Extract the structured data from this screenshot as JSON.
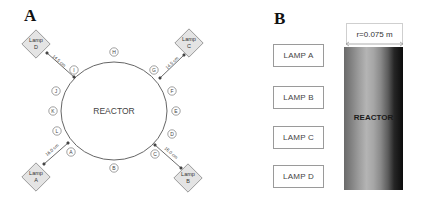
{
  "panel_a": {
    "letter": "A",
    "reactor_label": "REACTOR",
    "lamps": [
      {
        "id": "lamp-d",
        "line1": "Lamp",
        "line2": "D",
        "distance": "14.5 cm"
      },
      {
        "id": "lamp-c",
        "line1": "Lamp",
        "line2": "C",
        "distance": "14.5 cm"
      },
      {
        "id": "lamp-a",
        "line1": "Lamp",
        "line2": "A",
        "distance": "16.0 cm"
      },
      {
        "id": "lamp-b",
        "line1": "Lamp",
        "line2": "B",
        "distance": "16.0 cm"
      }
    ],
    "markers": [
      "A",
      "B",
      "C",
      "D",
      "E",
      "F",
      "G",
      "H",
      "I",
      "J",
      "K",
      "L"
    ]
  },
  "panel_b": {
    "letter": "B",
    "lamp_labels": [
      "LAMP A",
      "LAMP B",
      "LAMP C",
      "LAMP D"
    ],
    "reactor_label": "REACTOR",
    "dimension": "r=0.075 m"
  },
  "colors": {
    "line": "#555555",
    "lamp_fill": "#e4e4e4",
    "lamp_stroke": "#8a8a8a",
    "box_border": "#9a9a9a"
  }
}
